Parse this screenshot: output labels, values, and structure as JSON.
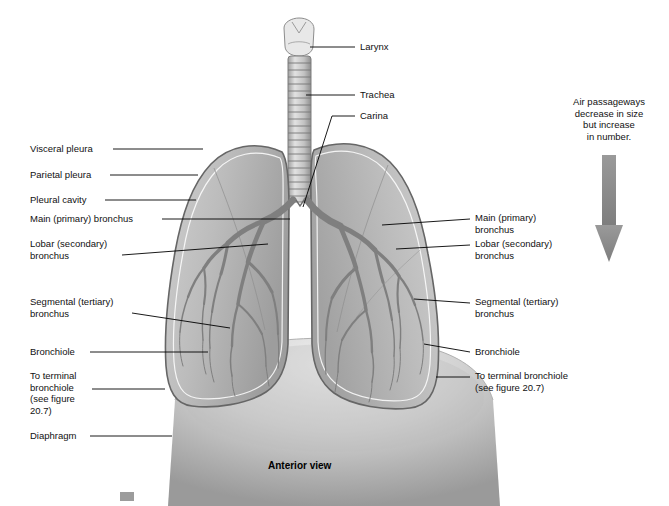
{
  "figure": {
    "title": "Anterior view",
    "note": "Air passageways\ndecrease in size\nbut increase\nin number.",
    "labels_left": [
      {
        "id": "visceral-pleura",
        "text": "Visceral pleura",
        "x": 30,
        "y": 143,
        "leader": [
          [
            113,
            149
          ],
          [
            203,
            149
          ]
        ]
      },
      {
        "id": "parietal-pleura",
        "text": "Parietal pleura",
        "x": 30,
        "y": 169,
        "leader": [
          [
            110,
            175
          ],
          [
            198,
            175
          ]
        ]
      },
      {
        "id": "pleural-cavity",
        "text": "Pleural cavity",
        "x": 30,
        "y": 194,
        "leader": [
          [
            105,
            200
          ],
          [
            196,
            200
          ]
        ]
      },
      {
        "id": "main-primary-bronchus-left",
        "text": "Main (primary) bronchus",
        "x": 30,
        "y": 213,
        "leader": [
          [
            162,
            219
          ],
          [
            290,
            219
          ]
        ]
      },
      {
        "id": "lobar-secondary-bronchus-left",
        "text": "Lobar (secondary)\nbronchus",
        "x": 30,
        "y": 238,
        "leader": [
          [
            122,
            255
          ],
          [
            268,
            244
          ]
        ]
      },
      {
        "id": "segmental-tertiary-bronchus-left",
        "text": "Segmental (tertiary)\nbronchus",
        "x": 30,
        "y": 296,
        "leader": [
          [
            132,
            313
          ],
          [
            230,
            328
          ]
        ]
      },
      {
        "id": "bronchiole-left",
        "text": "Bronchiole",
        "x": 30,
        "y": 346,
        "leader": [
          [
            90,
            352
          ],
          [
            208,
            352
          ]
        ]
      },
      {
        "id": "to-terminal-bronchiole-left",
        "text": "To terminal\nbronchiole\n(see figure\n20.7)",
        "x": 30,
        "y": 370,
        "leader": [
          [
            92,
            389
          ],
          [
            165,
            389
          ]
        ]
      },
      {
        "id": "diaphragm",
        "text": "Diaphragm",
        "x": 30,
        "y": 430,
        "leader": [
          [
            90,
            436
          ],
          [
            172,
            436
          ]
        ]
      }
    ],
    "labels_right": [
      {
        "id": "larynx",
        "text": "Larynx",
        "x": 360,
        "y": 41,
        "leader": [
          [
            355,
            47
          ],
          [
            310,
            47
          ]
        ]
      },
      {
        "id": "trachea",
        "text": "Trachea",
        "x": 360,
        "y": 89,
        "leader": [
          [
            355,
            95
          ],
          [
            306,
            95
          ]
        ]
      },
      {
        "id": "carina",
        "text": "Carina",
        "x": 360,
        "y": 110,
        "leader": [
          [
            355,
            116
          ],
          [
            330,
            116
          ],
          [
            303,
            215
          ]
        ]
      },
      {
        "id": "main-primary-bronchus-right",
        "text": "Main (primary)\nbronchus",
        "x": 475,
        "y": 212,
        "leader": [
          [
            470,
            219
          ],
          [
            382,
            225
          ]
        ]
      },
      {
        "id": "lobar-secondary-bronchus-right",
        "text": "Lobar (secondary)\nbronchus",
        "x": 475,
        "y": 238,
        "leader": [
          [
            470,
            245
          ],
          [
            395,
            248
          ]
        ]
      },
      {
        "id": "segmental-tertiary-bronchus-right",
        "text": "Segmental (tertiary)\nbronchus",
        "x": 475,
        "y": 296,
        "leader": [
          [
            470,
            303
          ],
          [
            415,
            300
          ]
        ]
      },
      {
        "id": "bronchiole-right",
        "text": "Bronchiole",
        "x": 475,
        "y": 346,
        "leader": [
          [
            470,
            352
          ],
          [
            424,
            344
          ]
        ]
      },
      {
        "id": "to-terminal-bronchiole-right",
        "text": "To terminal bronchiole\n(see figure 20.7)",
        "x": 475,
        "y": 370,
        "leader": [
          [
            470,
            377
          ],
          [
            434,
            377
          ]
        ]
      }
    ],
    "colors": {
      "lung_fill": "#b9b9b9",
      "lung_outline": "#6e6e6e",
      "airway": "#8c8c8c",
      "leader_line": "#000000",
      "arrow": "#8a8a8a",
      "diaphragm": "#c9c9c9",
      "background": "#ffffff"
    }
  }
}
